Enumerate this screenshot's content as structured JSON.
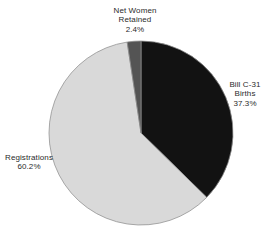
{
  "chart_data": {
    "type": "pie",
    "title": "",
    "slices": [
      {
        "label": "Bill C-31 Births",
        "value": 37.3,
        "display": "37.3%",
        "color": "#121212"
      },
      {
        "label": "Registrations",
        "value": 60.2,
        "display": "60.2%",
        "color": "#d9d9d9"
      },
      {
        "label": "Net Women Retained",
        "value": 2.4,
        "display": "2.4%",
        "color": "#545454"
      }
    ],
    "start_angle_deg": 0,
    "direction": "clockwise",
    "outline_color": "#8f8f8f",
    "label_color": "#2b2b2b",
    "background_color": "#ffffff",
    "legend": "none"
  },
  "labels": {
    "net_women": {
      "lines": [
        "Net Women",
        "Retained",
        "2.4%"
      ]
    },
    "bill_c31": {
      "lines": [
        "Bill C-31",
        "Births",
        "37.3%"
      ]
    },
    "registrations": {
      "lines": [
        "Registrations",
        "60.2%"
      ]
    }
  }
}
